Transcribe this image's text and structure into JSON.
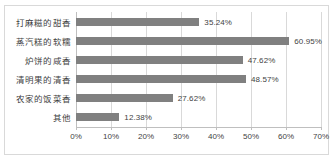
{
  "chart_data": {
    "type": "bar",
    "orientation": "horizontal",
    "title": "",
    "xlabel": "",
    "ylabel": "",
    "categories": [
      "打麻糍的甜香",
      "蒸汽糕的软糯",
      "炉饼的咸香",
      "清明果的清香",
      "农家的饭菜香",
      "其他"
    ],
    "values": [
      35.24,
      60.95,
      47.62,
      48.57,
      27.62,
      12.38
    ],
    "value_labels": [
      "35.24%",
      "60.95%",
      "47.62%",
      "48.57%",
      "27.62%",
      "12.38%"
    ],
    "xlim": [
      0,
      70
    ],
    "xticks": [
      0,
      10,
      20,
      30,
      40,
      50,
      60,
      70
    ],
    "xtick_labels": [
      "0%",
      "10%",
      "20%",
      "30%",
      "40%",
      "50%",
      "60%",
      "70%"
    ],
    "grid": true,
    "legend": false,
    "bar_color": "#808080",
    "gridline_color": "#d9d9d9",
    "text_color": "#3f3f3f",
    "background_color": "#ffffff",
    "border_color": "#d9d9d9"
  }
}
